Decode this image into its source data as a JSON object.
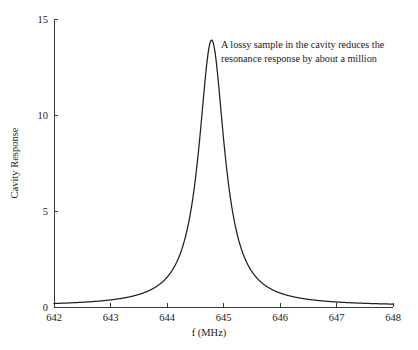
{
  "chart_data": {
    "type": "line",
    "title": "",
    "subtitle": "",
    "xlabel": "f (MHz)",
    "ylabel": "Cavity Response",
    "xlim": [
      642,
      648
    ],
    "ylim": [
      0,
      15
    ],
    "grid": false,
    "legend": false,
    "legend_position": "none",
    "x_ticks": [
      642,
      643,
      644,
      645,
      646,
      647,
      648
    ],
    "x_tick_labels": [
      "642",
      "643",
      "644",
      "645",
      "646",
      "647",
      "648"
    ],
    "y_ticks": [
      0,
      5,
      10,
      15
    ],
    "y_tick_labels": [
      "0",
      "5",
      "10",
      "15"
    ],
    "curve_model": "lorentzian",
    "peak_amplitude": 13.9,
    "peak_center": 644.79,
    "fwhm": 0.55,
    "baseline": 0.05,
    "line_color": "#1f1f1f",
    "axis_color": "#3b3b3b",
    "background_color": "#ffffff",
    "annotations": [
      {
        "name": "lossy-sample-note",
        "line1": "A lossy sample in the cavity reduces the",
        "line2": "resonance response by about a million",
        "x": 645.0,
        "y": 13.9
      }
    ],
    "x": [
      642.0,
      642.1,
      642.2,
      642.3,
      642.4,
      642.5,
      642.6,
      642.7,
      642.8,
      642.9,
      643.0,
      643.1,
      643.2,
      643.3,
      643.4,
      643.5,
      643.6,
      643.7,
      643.8,
      643.9,
      644.0,
      644.1,
      644.2,
      644.3,
      644.4,
      644.5,
      644.6,
      644.7,
      644.79,
      644.9,
      645.0,
      645.1,
      645.2,
      645.3,
      645.4,
      645.5,
      645.6,
      645.7,
      645.8,
      645.9,
      646.0,
      646.2,
      646.4,
      646.6,
      646.8,
      647.0,
      647.2,
      647.4,
      647.6,
      647.8,
      648.0
    ],
    "y": [
      0.06,
      0.07,
      0.08,
      0.09,
      0.1,
      0.12,
      0.14,
      0.16,
      0.19,
      0.23,
      0.28,
      0.34,
      0.42,
      0.52,
      0.66,
      0.85,
      1.11,
      1.49,
      2.05,
      2.93,
      4.36,
      6.7,
      9.6,
      12.23,
      13.65,
      13.87,
      13.4,
      13.85,
      13.9,
      12.4,
      9.9,
      7.15,
      5.05,
      3.6,
      2.65,
      2.0,
      1.56,
      1.25,
      1.02,
      0.85,
      0.72,
      0.54,
      0.42,
      0.34,
      0.28,
      0.23,
      0.2,
      0.17,
      0.14,
      0.12,
      0.1
    ]
  },
  "axes": {
    "y_axis_title": "Cavity Response",
    "x_axis_title": "f (MHz)"
  }
}
